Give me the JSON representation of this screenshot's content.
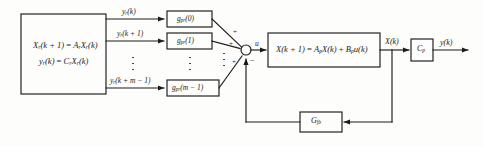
{
  "diagram": {
    "stroke_color": "#1b1b1b",
    "text_color": "#1a1a1a",
    "background": "#fdfdfc"
  },
  "reference_block": {
    "name": "reference-model-block",
    "line1_lhs": "X",
    "line1_lhs_sub": "r",
    "line1_arg": "(k + 1)",
    "line1_eq": " = ",
    "line1_rhs_a": "A",
    "line1_rhs_a_sub": "r",
    "line1_rhs_x": "X",
    "line1_rhs_x_sub": "r",
    "line1_rhs_arg": "(k)",
    "line2_lhs": "y",
    "line2_lhs_sub": "r",
    "line2_arg": "(k)",
    "line2_eq": " = ",
    "line2_rhs_c": "C",
    "line2_rhs_c_sub": "r",
    "line2_rhs_x": "X",
    "line2_rhs_x_sub": "r",
    "line2_rhs_arg": "(k)"
  },
  "signals": {
    "yr_k": {
      "base": "y",
      "sub": "r",
      "arg": "(k)"
    },
    "yr_k1": {
      "base": "y",
      "sub": "r",
      "arg": "(k + 1)"
    },
    "yr_kmm1": {
      "base": "y",
      "sub": "r",
      "arg": "(k + m − 1)"
    },
    "u": "u",
    "xk": {
      "base": "X",
      "arg": "(k)"
    },
    "yk": {
      "base": "y",
      "arg": "(k)"
    }
  },
  "gain_blocks": [
    {
      "name": "gpr-0",
      "base": "g",
      "sub": "pr",
      "arg": "(0)"
    },
    {
      "name": "gpr-1",
      "base": "g",
      "sub": "pr",
      "arg": "(1)"
    },
    {
      "name": "gpr-m-1",
      "base": "g",
      "sub": "pr",
      "arg": "(m − 1)"
    }
  ],
  "summing_junction": {
    "name": "summing-junction",
    "signs": [
      "+",
      "+",
      "+",
      "−"
    ]
  },
  "plant_block": {
    "name": "plant-state-equation-block",
    "lhs": "X",
    "lhs_arg": "(k + 1)",
    "eq": " = ",
    "a": "A",
    "a_sub": "p",
    "x": "X",
    "x_arg": "(k)",
    "plus": " + ",
    "b": "B",
    "b_sub": "p",
    "u": "u",
    "u_arg": "(k)"
  },
  "output_block": {
    "name": "output-matrix-block",
    "base": "C",
    "sub": "p"
  },
  "feedback_block": {
    "name": "feedback-gain-block",
    "base": "G",
    "sub": "fb"
  }
}
